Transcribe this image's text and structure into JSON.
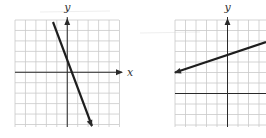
{
  "chart_data": [
    {
      "type": "line",
      "title": "",
      "xlabel": "x",
      "ylabel": "y",
      "grid": true,
      "cells_x": 10,
      "cells_y": 10,
      "origin_cell": {
        "col": 5,
        "row": 5
      },
      "xlim": [
        -5,
        5
      ],
      "ylim": [
        -5,
        5
      ],
      "series": [
        {
          "name": "line",
          "slope": -2.7,
          "intercept": 1.6,
          "x": [
            -1.25,
            2.5
          ],
          "y": [
            4.9,
            -5.1
          ],
          "arrows": "both-ends-down"
        }
      ],
      "pixel": {
        "left": 15,
        "top": 20,
        "cell": 10.45,
        "x_end": 119,
        "y_end": 127
      },
      "line_px": {
        "x1": 53,
        "y1": 22,
        "x2": 92,
        "y2": 126
      },
      "arrowhead_end": true
    },
    {
      "type": "line",
      "title": "",
      "xlabel": "",
      "ylabel": "y",
      "grid": true,
      "cells_x": 9,
      "cells_y": 10,
      "origin_cell": {
        "col": 5,
        "row": 7
      },
      "xlim": [
        -5,
        4
      ],
      "ylim": [
        -3,
        7
      ],
      "series": [
        {
          "name": "line",
          "slope": 0.333,
          "intercept": 4,
          "x": [
            -5,
            3.8
          ],
          "y": [
            2.33,
            5.27
          ],
          "arrows": "left-end"
        }
      ],
      "pixel": {
        "left": 175,
        "top": 20,
        "cell": 10.5,
        "x_end": 266,
        "y_end": 127
      },
      "line_px": {
        "x1": 175,
        "y1": 72.5,
        "x2": 266,
        "y2": 42
      },
      "arrowhead_start": true
    }
  ],
  "labels": {
    "left_y": "y",
    "left_x": "x",
    "right_y": "y"
  },
  "colors": {
    "grid": "#c9c9c9",
    "axis": "#2a2a2a",
    "line": "#1e1e1e",
    "background": "#ffffff"
  }
}
